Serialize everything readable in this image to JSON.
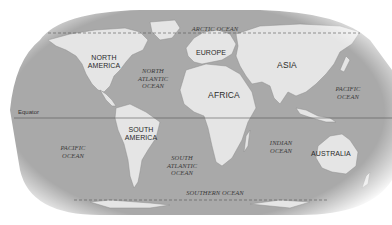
{
  "map": {
    "title": "World map",
    "colors": {
      "ocean": "#a8a8a8",
      "land": "#e6e6e6",
      "coast": "#8a8a8a",
      "background": "#ffffff",
      "line": "#555555"
    },
    "lines": {
      "equator": "Equator"
    },
    "continents": [
      {
        "id": "north-america",
        "label": "NORTH\nAMERICA",
        "line1": "NORTH",
        "line2": "AMERICA"
      },
      {
        "id": "south-america",
        "label": "SOUTH\nAMERICA",
        "line1": "SOUTH",
        "line2": "AMERICA"
      },
      {
        "id": "europe",
        "label": "EUROPE"
      },
      {
        "id": "africa",
        "label": "AFRICA"
      },
      {
        "id": "asia",
        "label": "ASIA"
      },
      {
        "id": "australia",
        "label": "AUSTRALIA"
      }
    ],
    "oceans": [
      {
        "id": "arctic",
        "label": "ARCTIC OCEAN"
      },
      {
        "id": "north-atlantic",
        "line1": "NORTH",
        "line2": "ATLANTIC",
        "line3": "OCEAN"
      },
      {
        "id": "south-atlantic",
        "line1": "SOUTH",
        "line2": "ATLANTIC",
        "line3": "OCEAN"
      },
      {
        "id": "pacific-west",
        "line1": "PACIFIC",
        "line2": "OCEAN"
      },
      {
        "id": "pacific-east",
        "line1": "PACIFIC",
        "line2": "OCEAN"
      },
      {
        "id": "indian",
        "line1": "INDIAN",
        "line2": "OCEAN"
      },
      {
        "id": "southern",
        "label": "SOUTHERN OCEAN"
      }
    ]
  }
}
